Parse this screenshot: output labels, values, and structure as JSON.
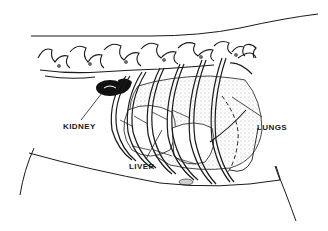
{
  "diagram": {
    "colors": {
      "ink": "#1a1a1a",
      "background": "#ffffff",
      "kidney_fill": "#111111",
      "stipple": "#555555"
    },
    "labels": [
      {
        "id": "kidney",
        "text": "KIDNEY",
        "x": 63,
        "y": 123
      },
      {
        "id": "liver",
        "text": "LIVER",
        "x": 129,
        "y": 163
      },
      {
        "id": "lungs",
        "text": "LUNGS",
        "x": 257,
        "y": 124
      }
    ],
    "leaders": [
      {
        "from_label": "kidney",
        "x1": 81,
        "y1": 120,
        "x2": 102,
        "y2": 93
      },
      {
        "from_label": "liver",
        "x1": 146,
        "y1": 159,
        "x2": 162,
        "y2": 130
      },
      {
        "from_label": "lungs",
        "x1": 262,
        "y1": 117,
        "x2": 232,
        "y2": 97
      }
    ]
  }
}
